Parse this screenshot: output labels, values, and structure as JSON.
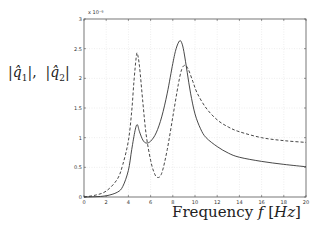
{
  "chart_data": {
    "type": "line",
    "title": "",
    "xlabel": "Frequency f [Hz]",
    "ylabel": "|q̂1|, |q̂2|",
    "y_multiplier": "x 10⁻⁶",
    "xlim": [
      0,
      20
    ],
    "ylim": [
      0,
      3
    ],
    "xticks": [
      0,
      2,
      4,
      6,
      8,
      10,
      12,
      14,
      16,
      18,
      20
    ],
    "yticks": [
      0,
      0.5,
      1,
      1.5,
      2,
      2.5,
      3
    ],
    "ytick_labels": [
      "0",
      "0.5",
      "1",
      "1.5",
      "2",
      "2.5",
      "3"
    ],
    "grid": true,
    "legend": null,
    "series": [
      {
        "name": "|q̂1|",
        "style": "solid",
        "x": [
          0,
          1,
          2,
          3,
          3.5,
          4,
          4.3,
          4.6,
          4.8,
          5.0,
          5.3,
          5.6,
          6.0,
          6.5,
          7.0,
          7.5,
          8.0,
          8.3,
          8.6,
          8.8,
          9.0,
          9.3,
          9.6,
          10,
          10.5,
          11,
          12,
          13,
          14,
          16,
          18,
          20
        ],
        "y": [
          0,
          0.005,
          0.02,
          0.08,
          0.18,
          0.45,
          0.8,
          1.12,
          1.22,
          1.1,
          0.96,
          0.91,
          0.94,
          1.08,
          1.35,
          1.75,
          2.25,
          2.5,
          2.63,
          2.6,
          2.45,
          2.1,
          1.75,
          1.4,
          1.15,
          1.0,
          0.85,
          0.74,
          0.67,
          0.6,
          0.55,
          0.51
        ]
      },
      {
        "name": "|q̂2|",
        "style": "dashed",
        "x": [
          0,
          1,
          2,
          3,
          3.5,
          4,
          4.3,
          4.5,
          4.7,
          4.8,
          5.0,
          5.3,
          5.6,
          6.0,
          6.3,
          6.6,
          7.0,
          7.5,
          8.0,
          8.5,
          8.8,
          9.1,
          9.4,
          9.8,
          10.2,
          11,
          12,
          13,
          14,
          16,
          18,
          20
        ],
        "y": [
          0,
          0.03,
          0.1,
          0.3,
          0.55,
          0.95,
          1.45,
          1.95,
          2.35,
          2.42,
          2.2,
          1.6,
          1.05,
          0.62,
          0.42,
          0.33,
          0.4,
          0.8,
          1.35,
          1.9,
          2.15,
          2.22,
          2.15,
          1.95,
          1.75,
          1.5,
          1.3,
          1.18,
          1.1,
          1.0,
          0.95,
          0.92
        ]
      }
    ]
  }
}
